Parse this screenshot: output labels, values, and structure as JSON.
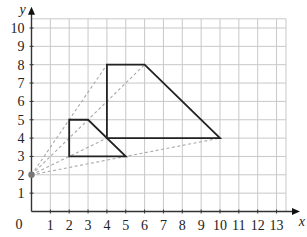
{
  "diagram": {
    "type": "coordinate-grid-enlargement",
    "axes": {
      "x_label": "x",
      "y_label": "y",
      "origin_label": "0",
      "x_ticks": [
        "1",
        "2",
        "3",
        "4",
        "5",
        "6",
        "7",
        "8",
        "9",
        "10",
        "11",
        "12",
        "13"
      ],
      "y_ticks": [
        "1",
        "2",
        "3",
        "4",
        "5",
        "6",
        "7",
        "8",
        "9",
        "10"
      ],
      "x_range": [
        0,
        13.5
      ],
      "y_range": [
        0,
        10.5
      ]
    },
    "center_of_enlargement": {
      "x": 0,
      "y": 2,
      "color": "#777777"
    },
    "small_shape": {
      "vertices": [
        [
          2,
          3
        ],
        [
          2,
          5
        ],
        [
          3,
          5
        ],
        [
          5,
          3
        ]
      ],
      "stroke": "#222222"
    },
    "large_shape": {
      "vertices": [
        [
          4,
          4
        ],
        [
          4,
          8
        ],
        [
          6,
          8
        ],
        [
          10,
          4
        ]
      ],
      "stroke": "#222222"
    },
    "construction_lines": [
      {
        "from": [
          0,
          2
        ],
        "to": [
          4,
          8
        ]
      },
      {
        "from": [
          0,
          2
        ],
        "to": [
          6,
          8
        ]
      },
      {
        "from": [
          0,
          2
        ],
        "to": [
          4,
          4
        ]
      },
      {
        "from": [
          0,
          2
        ],
        "to": [
          10,
          4
        ]
      }
    ],
    "colors": {
      "grid": "#c8c8c8",
      "axis": "#333333",
      "dashed": "#aaaaaa"
    }
  }
}
